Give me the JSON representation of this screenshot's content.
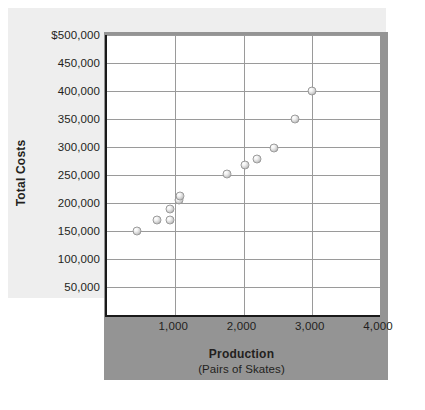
{
  "chart_data": {
    "type": "scatter",
    "title": "",
    "xlabel": "Production",
    "xlabel_sub": "(Pairs of Skates)",
    "ylabel": "Total Costs",
    "xlim": [
      0,
      4000
    ],
    "ylim": [
      0,
      500000
    ],
    "grid": true,
    "legend": "none",
    "x_ticks": [
      {
        "value": 1000,
        "label": "1,000"
      },
      {
        "value": 2000,
        "label": "2,000"
      },
      {
        "value": 3000,
        "label": "3,000"
      },
      {
        "value": 4000,
        "label": "4,000"
      }
    ],
    "y_ticks": [
      {
        "value": 500000,
        "label": "$500,000"
      },
      {
        "value": 450000,
        "label": "450,000"
      },
      {
        "value": 400000,
        "label": "400,000"
      },
      {
        "value": 350000,
        "label": "350,000"
      },
      {
        "value": 300000,
        "label": "300,000"
      },
      {
        "value": 250000,
        "label": "250,000"
      },
      {
        "value": 200000,
        "label": "200,000"
      },
      {
        "value": 150000,
        "label": "150,000"
      },
      {
        "value": 100000,
        "label": "100,000"
      },
      {
        "value": 50000,
        "label": "50,000"
      }
    ],
    "points": [
      {
        "x": 440,
        "y": 150000
      },
      {
        "x": 730,
        "y": 170000
      },
      {
        "x": 920,
        "y": 190000
      },
      {
        "x": 920,
        "y": 170000
      },
      {
        "x": 1050,
        "y": 205000
      },
      {
        "x": 1075,
        "y": 212000
      },
      {
        "x": 1760,
        "y": 252000
      },
      {
        "x": 2020,
        "y": 268000
      },
      {
        "x": 2200,
        "y": 278000
      },
      {
        "x": 2450,
        "y": 298000
      },
      {
        "x": 2760,
        "y": 350000
      },
      {
        "x": 3000,
        "y": 400000
      }
    ],
    "colors": {
      "plot_background": "#ffffff",
      "light_panel": "#eeeeee",
      "shadow_panel": "#949494",
      "gridline": "#9a9a9a",
      "axis": "#1a1a1a",
      "marker": "#cfcfcf",
      "text": "#231f20"
    }
  }
}
